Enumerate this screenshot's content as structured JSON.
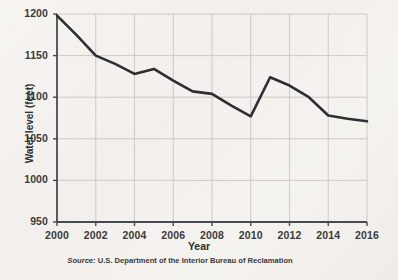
{
  "chart_data": {
    "type": "line",
    "title": "",
    "xlabel": "Year",
    "ylabel": "Water level (feet)",
    "xlim": [
      2000,
      2016
    ],
    "ylim": [
      950,
      1200
    ],
    "grid": true,
    "legend": "none",
    "x_ticks": [
      "2000",
      "2002",
      "2004",
      "2006",
      "2008",
      "2010",
      "2012",
      "2014",
      "2016"
    ],
    "y_ticks": [
      "950",
      "1000",
      "1050",
      "1100",
      "1150",
      "1200"
    ],
    "x": [
      2000,
      2001,
      2002,
      2003,
      2004,
      2005,
      2006,
      2007,
      2008,
      2009,
      2010,
      2011,
      2012,
      2013,
      2014,
      2015,
      2016
    ],
    "values": [
      1198,
      1175,
      1150,
      1140,
      1128,
      1134,
      1120,
      1107,
      1104,
      1090,
      1077,
      1124,
      1114,
      1100,
      1078,
      1074,
      1071
    ],
    "series": [
      {
        "name": "Water level",
        "values": [
          1198,
          1175,
          1150,
          1140,
          1128,
          1134,
          1120,
          1107,
          1104,
          1090,
          1077,
          1124,
          1114,
          1100,
          1078,
          1074,
          1071
        ]
      }
    ],
    "line_color": "#2e2e2e",
    "grid_color": "#c9c5c0",
    "axis_color": "#4a4a4a",
    "background_color": "#f4f2ef"
  },
  "caption": {
    "source_word": "Source:",
    "source_text": "U.S. Department of the Interior Bureau of Reclamation"
  }
}
